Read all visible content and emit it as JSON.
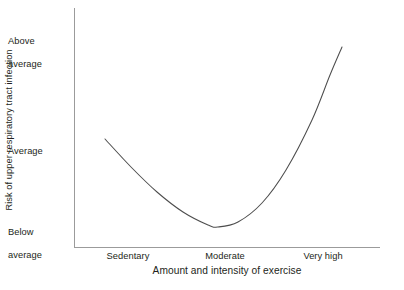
{
  "chart_data": {
    "type": "line",
    "title": "",
    "xlabel": "Amount and intensity of exercise",
    "ylabel": "Risk of upper respiratory tract infection",
    "grid": false,
    "legend": false,
    "categories": [
      "Sedentary",
      "Moderate",
      "Very high"
    ],
    "y_tick_labels": [
      "Above average",
      "Average",
      "Below average"
    ],
    "y_tick_lines": [
      [
        "Above",
        "average"
      ],
      [
        "Average"
      ],
      [
        "Below",
        "average"
      ]
    ],
    "ylim": [
      "Below average",
      "Above average"
    ],
    "xlim": [
      "Sedentary",
      "Very high"
    ],
    "series": [
      {
        "name": "Risk of upper respiratory tract infection",
        "shape": "J-curve",
        "color": "#4d4d4d",
        "points": [
          {
            "x": "Sedentary",
            "y": "Average"
          },
          {
            "x": "Moderate",
            "y": "Below average"
          },
          {
            "x": "Very high",
            "y": "Above average"
          }
        ],
        "pixel_path": [
          [
            105,
            139
          ],
          [
            131,
            167
          ],
          [
            157,
            192
          ],
          [
            183,
            212
          ],
          [
            208,
            225
          ],
          [
            218,
            227
          ],
          [
            238,
            222
          ],
          [
            262,
            203
          ],
          [
            286,
            170
          ],
          [
            312,
            120
          ],
          [
            330,
            75
          ],
          [
            342,
            47
          ]
        ]
      }
    ]
  },
  "axis": {
    "y_axis_title": "Risk of upper respiratory tract infection",
    "x_axis_title": "Amount and intensity of exercise",
    "y_ticks": [
      {
        "id": "above",
        "line1": "Above",
        "line2": "average"
      },
      {
        "id": "average",
        "line1": "Average",
        "line2": ""
      },
      {
        "id": "below",
        "line1": "Below",
        "line2": "average"
      }
    ],
    "x_ticks": [
      {
        "id": "sedentary",
        "label": "Sedentary"
      },
      {
        "id": "moderate",
        "label": "Moderate"
      },
      {
        "id": "veryhigh",
        "label": "Very high"
      }
    ],
    "axis_color": "#9b9b9b",
    "curve_color": "#4d4d4d"
  },
  "artifacts": {
    "clipped_top_caption": ""
  }
}
